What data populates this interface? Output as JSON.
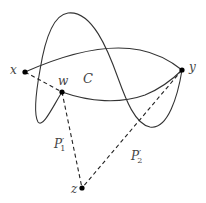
{
  "diagram": {
    "type": "path-construction",
    "colors": {
      "stroke": "#333333",
      "points": "#000000",
      "labels": "#444444",
      "background": "#ffffff"
    },
    "points": [
      {
        "id": "x",
        "label": "x",
        "cx": 25,
        "cy": 72
      },
      {
        "id": "w",
        "label": "w",
        "cx": 62,
        "cy": 92
      },
      {
        "id": "y",
        "label": "y",
        "cx": 182,
        "cy": 70
      },
      {
        "id": "z",
        "label": "z",
        "cx": 82,
        "cy": 188
      }
    ],
    "region_label": "C",
    "paths": [
      {
        "id": "P1",
        "label": "P",
        "sub": "1",
        "prime": "′",
        "from": "w",
        "to": "z",
        "style": "dashed"
      },
      {
        "id": "P2",
        "label": "P",
        "sub": "2",
        "prime": "′",
        "from": "y",
        "to": "z",
        "style": "dashed"
      },
      {
        "id": "xw",
        "from": "x",
        "to": "w",
        "style": "dashed"
      }
    ],
    "curves": [
      {
        "id": "upper-arc",
        "from": "x",
        "to": "y",
        "style": "solid"
      },
      {
        "id": "lower-arc",
        "from": "w",
        "to": "y",
        "style": "solid"
      },
      {
        "id": "wavy-curve",
        "from": "y",
        "to": "w",
        "style": "solid"
      }
    ]
  }
}
